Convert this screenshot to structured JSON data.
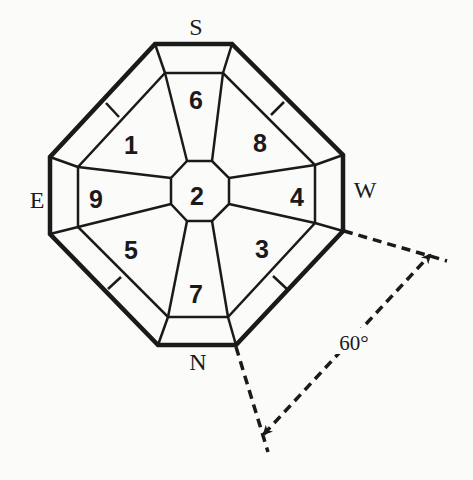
{
  "diagram": {
    "type": "bagua-octagon-compass",
    "directions": {
      "top": "S",
      "bottom": "N",
      "left": "E",
      "right": "W"
    },
    "sectors": {
      "top": "6",
      "top_left": "1",
      "top_right": "8",
      "left": "9",
      "center": "2",
      "right": "4",
      "bottom_left": "5",
      "bottom": "7",
      "bottom_right": "3"
    },
    "angle_annotation": {
      "label": "60°",
      "description": "dashed lines extending from lower-right edge with double-headed dashed arrow indicating a 60 degree angle"
    },
    "colors": {
      "line": "#1a1a1a",
      "background": "#fbfbfa"
    }
  }
}
